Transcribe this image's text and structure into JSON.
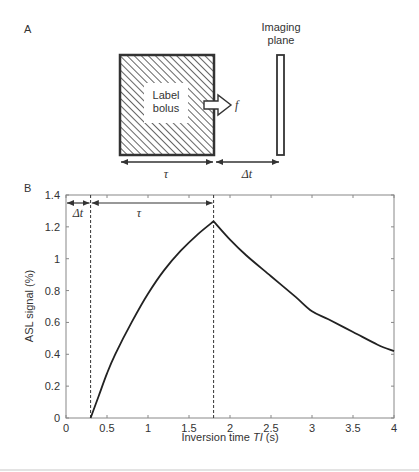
{
  "panel_a": {
    "label": "A",
    "bolus_label_line1": "Label",
    "bolus_label_line2": "bolus",
    "flow_symbol": "f",
    "imaging_plane_line1": "Imaging",
    "imaging_plane_line2": "plane",
    "tau_symbol": "τ",
    "delta_t_symbol": "Δt"
  },
  "panel_b": {
    "label": "B",
    "delta_t_symbol": "Δt",
    "tau_symbol": "τ"
  },
  "chart_data": {
    "type": "line",
    "title": "",
    "xlabel": "Inversion time TI (s)",
    "xlabel_prefix": "Inversion time ",
    "xlabel_italic": "TI",
    "xlabel_suffix": " (s)",
    "ylabel": "ASL signal (%)",
    "xlim": [
      0,
      4
    ],
    "ylim": [
      0,
      1.4
    ],
    "xticks": [
      "0",
      "0.5",
      "1",
      "1.5",
      "2",
      "2.5",
      "3",
      "3.5",
      "4"
    ],
    "yticks": [
      "0",
      "0.2",
      "0.4",
      "0.6",
      "0.8",
      "1",
      "1.2",
      "1.4"
    ],
    "grid": false,
    "annotations": [
      {
        "type": "vline",
        "x": 0.3,
        "style": "dashed"
      },
      {
        "type": "vline",
        "x": 1.8,
        "style": "dashed"
      },
      {
        "type": "double-arrow",
        "from": 0,
        "to": 0.3,
        "y": 1.35,
        "label": "Δt"
      },
      {
        "type": "double-arrow",
        "from": 0.3,
        "to": 1.8,
        "y": 1.35,
        "label": "τ"
      }
    ],
    "series": [
      {
        "name": "ASL signal",
        "x": [
          0.3,
          0.4,
          0.5,
          0.6,
          0.8,
          1.0,
          1.2,
          1.4,
          1.6,
          1.8,
          2.0,
          2.2,
          2.5,
          2.8,
          3.0,
          3.2,
          3.5,
          3.8,
          4.0
        ],
        "values": [
          0.0,
          0.14,
          0.28,
          0.4,
          0.6,
          0.78,
          0.93,
          1.05,
          1.15,
          1.235,
          1.12,
          1.02,
          0.89,
          0.76,
          0.67,
          0.62,
          0.54,
          0.46,
          0.42
        ]
      }
    ]
  }
}
